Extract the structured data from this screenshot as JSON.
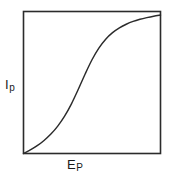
{
  "figure": {
    "name": "polarographic-wave",
    "background_color": "#ffffff",
    "line_color": "#2b2b2b",
    "frame_color": "#2b2b2b"
  },
  "axes": {
    "y_label_main": "I",
    "y_label_sub": "p",
    "x_label_main": "E",
    "x_label_sub": "P"
  },
  "chart_data": {
    "type": "line",
    "title": "",
    "xlabel": "Ep",
    "ylabel": "Ip",
    "xlim": [
      0,
      1
    ],
    "ylim": [
      0,
      1
    ],
    "grid": false,
    "legend": null,
    "tick_labels": {
      "x": [],
      "y": []
    },
    "series": [
      {
        "name": "polarographic wave",
        "color": "#2b2b2b",
        "x": [
          0.0,
          0.05,
          0.1,
          0.15,
          0.2,
          0.25,
          0.3,
          0.35,
          0.4,
          0.45,
          0.5,
          0.55,
          0.6,
          0.65,
          0.7,
          0.75,
          0.8,
          0.85,
          0.9,
          0.95,
          1.0
        ],
        "y": [
          0.0,
          0.025,
          0.055,
          0.092,
          0.137,
          0.193,
          0.263,
          0.35,
          0.452,
          0.56,
          0.66,
          0.742,
          0.805,
          0.851,
          0.885,
          0.91,
          0.93,
          0.945,
          0.957,
          0.967,
          0.975
        ]
      }
    ],
    "annotations": []
  }
}
